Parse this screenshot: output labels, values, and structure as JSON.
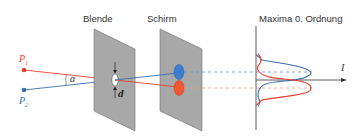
{
  "labels": {
    "aperture": "Blende",
    "screen": "Schirm",
    "maxima": "Maxima 0. Ordnung",
    "p1": "P",
    "p1_sub": "1",
    "p2": "P",
    "p2_sub": "2",
    "alpha": "α",
    "diameter": "d",
    "intensity": "I"
  },
  "colors": {
    "red": "#e8412c",
    "blue": "#3a6fb0",
    "plane": "#a8a8a8",
    "plane_edge": "#6e6e6e",
    "axis": "#333333"
  },
  "diagram": {
    "points": [
      {
        "id": "P1",
        "x": 24,
        "y": 70,
        "color": "red"
      },
      {
        "id": "P2",
        "x": 24,
        "y": 90,
        "color": "blue"
      }
    ],
    "planes": [
      {
        "id": "Blende",
        "corners": [
          [
            94,
            29
          ],
          [
            135,
            49
          ],
          [
            135,
            131
          ],
          [
            94,
            111
          ]
        ]
      },
      {
        "id": "Schirm",
        "corners": [
          [
            160,
            29
          ],
          [
            202,
            49
          ],
          [
            202,
            131
          ],
          [
            160,
            111
          ]
        ]
      }
    ],
    "intensity_axis": {
      "x": 256,
      "y_top": 26,
      "y_bottom": 130,
      "arrow_y": 80,
      "arrow_end_x": 345
    }
  }
}
